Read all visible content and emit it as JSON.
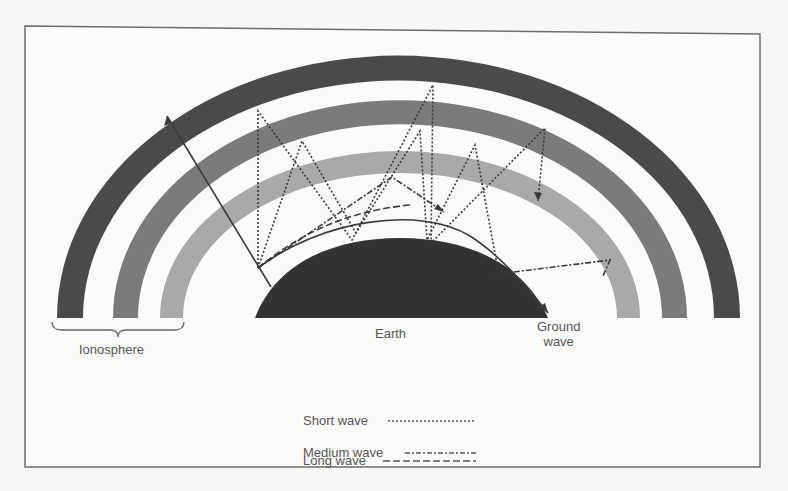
{
  "diagram": {
    "type": "radio wave propagation through ionosphere",
    "labels": {
      "ionosphere": "Ionosphere",
      "earth": "Earth",
      "ground_wave_line1": "Ground",
      "ground_wave_line2": "wave"
    },
    "legend": [
      {
        "label": "Short wave",
        "style": "dotted"
      },
      {
        "label": "Medium wave",
        "style": "dash-dot"
      },
      {
        "label": "Long wave",
        "style": "dashed"
      }
    ],
    "colors": {
      "background": "#f7f7f6",
      "frame": "#6e6e6e",
      "outer_band": "#4a4a4a",
      "middle_band": "#7b7b7b",
      "inner_band": "#a9a9a9",
      "earth": "#333333",
      "wave_lines": "#3a3a3a",
      "text": "#555555"
    }
  }
}
